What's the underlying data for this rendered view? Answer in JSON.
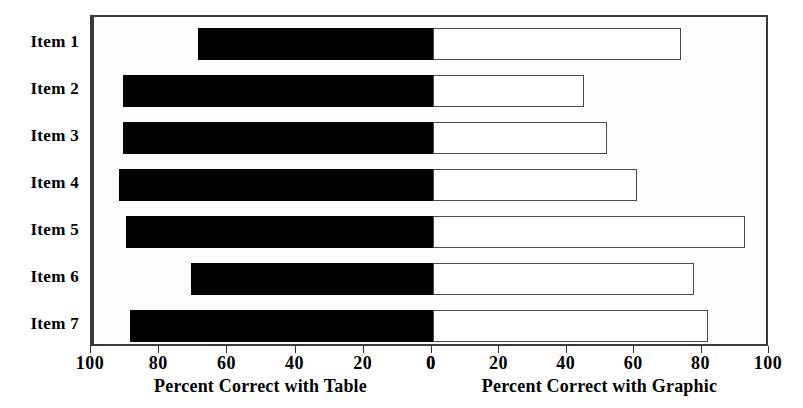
{
  "chart_data": {
    "type": "bar",
    "orientation": "horizontal",
    "subtype": "diverging-bidirectional",
    "title": "",
    "categories": [
      "Item 1",
      "Item 2",
      "Item 3",
      "Item 4",
      "Item 5",
      "Item 6",
      "Item 7"
    ],
    "series": [
      {
        "name": "Percent Correct with Table",
        "direction": "left",
        "fill": "#000000",
        "values": [
          69,
          91,
          91,
          92,
          90,
          71,
          89
        ]
      },
      {
        "name": "Percent Correct with Graphic",
        "direction": "right",
        "fill": "#ffffff",
        "values": [
          74,
          45,
          52,
          61,
          93,
          78,
          82
        ]
      }
    ],
    "left_axis": {
      "label": "Percent Correct with Table",
      "ticks": [
        100,
        80,
        60,
        40,
        20,
        0
      ],
      "range": [
        100,
        0
      ],
      "reversed": true
    },
    "right_axis": {
      "label": "Percent Correct with Graphic",
      "ticks": [
        0,
        20,
        40,
        60,
        80,
        100
      ],
      "range": [
        0,
        100
      ],
      "reversed": false
    },
    "grid": false,
    "legend": "none",
    "colors": {
      "table_bar": "#000000",
      "graphic_bar": "#ffffff",
      "outline": "#3a3a3a",
      "background": "#ffffff"
    }
  }
}
